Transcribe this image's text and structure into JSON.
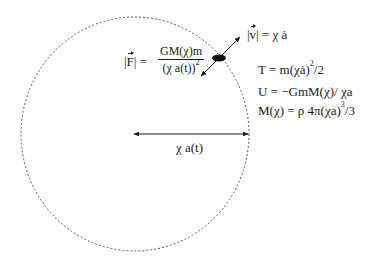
{
  "diagram": {
    "type": "physics-schematic",
    "shell": {
      "shape": "circle",
      "style": "dotted",
      "center": [
        135,
        134
      ],
      "rx": 114,
      "ry": 117,
      "color": "#555555"
    },
    "radius_arrow": {
      "from": [
        134,
        134
      ],
      "to": [
        248,
        134
      ],
      "heads": "both",
      "label": "χ a(t)"
    },
    "particle": {
      "shape": "ellipse",
      "center": [
        219,
        58
      ],
      "rx": 7,
      "ry": 3.5,
      "color": "#111111"
    },
    "velocity_arrow": {
      "from": [
        201,
        76
      ],
      "to": [
        240,
        37
      ],
      "heads": "both"
    },
    "labels": {
      "velocity": {
        "lhs_bar": "|",
        "lhs_symbol": "v",
        "rhs": "= χ ȧ"
      },
      "force": {
        "lhs_open": "|",
        "lhs_symbol": "F",
        "lhs_close": "| =",
        "numerator": "GM(χ)m",
        "denominator_base": "(χ a(t))",
        "denominator_exp": "2"
      },
      "kinetic": {
        "text": "T = m(χȧ)",
        "exp": "2",
        "tail": "/2"
      },
      "potential": {
        "text": "U = −GmM(χ)/ χa"
      },
      "mass": {
        "text": "M(χ) = ρ 4π(χa)",
        "exp": "3",
        "tail": "/3"
      }
    }
  }
}
